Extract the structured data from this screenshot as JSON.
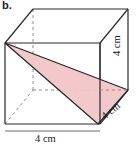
{
  "figure": {
    "part_label": "b.",
    "shape": "cube",
    "projection": "oblique",
    "shaded_region": "triangle",
    "colors": {
      "edge": "#2b2b2b",
      "hidden_edge": "#8c8c8c",
      "shade_fill": "#f2c5c8",
      "shade_stroke": "#262626",
      "background": "#ffffff",
      "text": "#1a1a1a"
    },
    "dimensions": {
      "width_label": "4 cm",
      "height_label": "4 cm",
      "depth_label": "4 cm"
    },
    "geometry": {
      "front_top_left": [
        5,
        43
      ],
      "front_top_right": [
        100,
        43
      ],
      "front_bottom_right": [
        100,
        124
      ],
      "front_bottom_left": [
        5,
        124
      ],
      "back_top_left": [
        33,
        9
      ],
      "back_top_right": [
        128,
        9
      ],
      "back_bottom_right": [
        128,
        90
      ],
      "back_bottom_left": [
        33,
        90
      ],
      "triangle_vertices": [
        [
          5,
          43
        ],
        [
          98,
          124
        ],
        [
          128,
          90
        ]
      ]
    }
  }
}
